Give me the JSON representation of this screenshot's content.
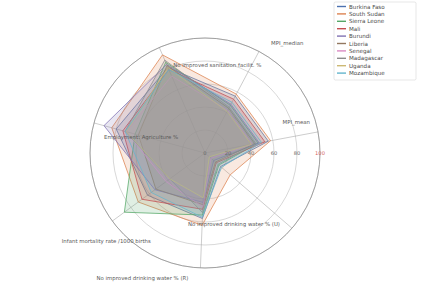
{
  "chart_data": {
    "type": "radar",
    "title": "",
    "xlabel": "",
    "ylabel": "",
    "rlim": [
      0,
      100
    ],
    "rticks": [
      0,
      20,
      40,
      60,
      80,
      100
    ],
    "rtick_labels": [
      "0",
      "20",
      "40",
      "60",
      "80",
      "100"
    ],
    "grid": true,
    "legend_position": "upper right",
    "categories": [
      "MPI_median",
      "No improved sanitation facilit. %",
      "Employment: Agriculture %",
      "Infant mortality rate /1000 births",
      "No improved drinking water % (R)",
      "No improved drinking water % (U)",
      "MPI_mean"
    ],
    "series": [
      {
        "name": "Burkina Faso",
        "color": "#4c72b0",
        "values": [
          56,
          81,
          80,
          62,
          57,
          18,
          56
        ]
      },
      {
        "name": "South Sudan",
        "color": "#dd8452",
        "values": [
          58,
          93,
          84,
          72,
          63,
          29,
          58
        ]
      },
      {
        "name": "Sierra Leone",
        "color": "#55a868",
        "values": [
          47,
          86,
          63,
          87,
          54,
          16,
          47
        ]
      },
      {
        "name": "Mali",
        "color": "#c44e52",
        "values": [
          53,
          79,
          74,
          68,
          49,
          13,
          53
        ]
      },
      {
        "name": "Burundi",
        "color": "#8172b3",
        "values": [
          48,
          84,
          91,
          54,
          43,
          10,
          48
        ]
      },
      {
        "name": "Liberia",
        "color": "#937860",
        "values": [
          44,
          83,
          60,
          53,
          45,
          12,
          44
        ]
      },
      {
        "name": "Senegal",
        "color": "#da8bc3",
        "values": [
          42,
          73,
          71,
          42,
          47,
          7,
          42
        ]
      },
      {
        "name": "Madagascar",
        "color": "#8c8c8c",
        "values": [
          45,
          88,
          72,
          38,
          52,
          15,
          45
        ]
      },
      {
        "name": "Uganda",
        "color": "#ccb974",
        "values": [
          41,
          81,
          71,
          38,
          39,
          5,
          41
        ]
      },
      {
        "name": "Mozambique",
        "color": "#64b5cd",
        "values": [
          50,
          79,
          72,
          58,
          56,
          19,
          50
        ]
      }
    ]
  },
  "legend": {
    "items": [
      {
        "label": "Burkina Faso"
      },
      {
        "label": "South Sudan"
      },
      {
        "label": "Sierra Leone"
      },
      {
        "label": "Mali"
      },
      {
        "label": "Burundi"
      },
      {
        "label": "Liberia"
      },
      {
        "label": "Senegal"
      },
      {
        "label": "Madagascar"
      },
      {
        "label": "Uganda"
      },
      {
        "label": "Mozambique"
      }
    ]
  }
}
